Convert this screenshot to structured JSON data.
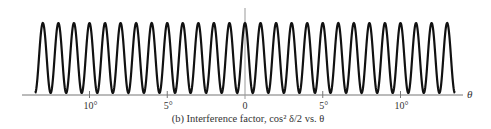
{
  "chart_data": {
    "type": "line",
    "title": "",
    "caption": "(b) Interference factor, cos² δ/2 vs. θ",
    "xlabel": "θ",
    "ylabel": "",
    "function": "cos^2(pi * theta / period)",
    "period_deg": 1,
    "xlim": [
      -14.5,
      14.3
    ],
    "curve_range": [
      -13.5,
      13.5
    ],
    "ylim": [
      0,
      1
    ],
    "peaks_at_deg": [
      -13,
      -12,
      -11,
      -10,
      -9,
      -8,
      -7,
      -6,
      -5,
      -4,
      -3,
      -2,
      -1,
      0,
      1,
      2,
      3,
      4,
      5,
      6,
      7,
      8,
      9,
      10,
      11,
      12,
      13
    ],
    "peak_value": 1,
    "min_value": 0,
    "x_ticks": [
      {
        "value": -10,
        "label": "10°"
      },
      {
        "value": -5,
        "label": "5°"
      },
      {
        "value": 0,
        "label": "0"
      },
      {
        "value": 5,
        "label": "5°"
      },
      {
        "value": 10,
        "label": "10°"
      }
    ],
    "center_line": true,
    "grid": false,
    "legend": "none",
    "colors": {
      "curve": "#111111",
      "axis": "#777777"
    }
  }
}
